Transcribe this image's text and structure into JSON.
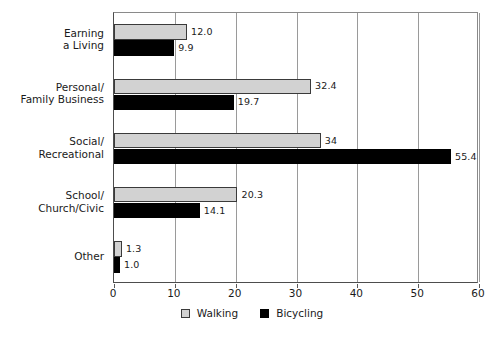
{
  "chart_data": {
    "type": "bar",
    "orientation": "horizontal",
    "title": "",
    "subtitle": "",
    "xlabel": "",
    "ylabel": "",
    "xlim": [
      0,
      60
    ],
    "xticks": [
      0,
      10,
      20,
      30,
      40,
      50,
      60
    ],
    "xtick_labels": [
      "0",
      "10",
      "20",
      "30",
      "40",
      "50",
      "60"
    ],
    "grid": true,
    "grid_axis": "x",
    "legend_position": "bottom-center",
    "categories": [
      "Earning a Living",
      "Personal/Family Business",
      "Social/Recreational",
      "School/Church/Civic",
      "Other"
    ],
    "category_label_lines": [
      [
        "Earning",
        "a Living"
      ],
      [
        "Personal/",
        "Family Business"
      ],
      [
        "Social/",
        "Recreational"
      ],
      [
        "School/",
        "Church/Civic"
      ],
      [
        "Other"
      ]
    ],
    "series": [
      {
        "name": "Walking",
        "color": "#d2d2d2",
        "values": [
          12.0,
          32.4,
          34,
          20.3,
          1.3
        ],
        "data_labels": [
          "12.0",
          "32.4",
          "34",
          "20.3",
          "1.3"
        ]
      },
      {
        "name": "Bicycling",
        "color": "#000000",
        "values": [
          9.9,
          19.7,
          55.4,
          14.1,
          1.0
        ],
        "data_labels": [
          "9.9",
          "19.7",
          "55.4",
          "14.1",
          "1.0"
        ]
      }
    ],
    "legend": [
      {
        "label": "Walking",
        "swatch": "light-gray-square"
      },
      {
        "label": "Bicycling",
        "swatch": "black-square"
      }
    ]
  }
}
